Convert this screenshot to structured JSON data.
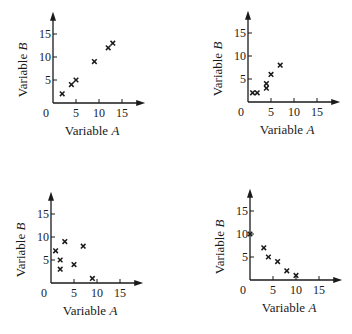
{
  "chart_data": [
    {
      "type": "scatter",
      "panel": "top-left",
      "title": "",
      "xlabel": "Variable A",
      "ylabel": "Variable B",
      "xticks": [
        "0",
        "5",
        "10",
        "15"
      ],
      "yticks": [
        "5",
        "10",
        "15"
      ],
      "xlim": [
        0,
        17
      ],
      "ylim": [
        0,
        17
      ],
      "grid": false,
      "marker": "x",
      "points": [
        [
          2,
          2
        ],
        [
          4,
          4
        ],
        [
          5,
          5
        ],
        [
          9,
          9
        ],
        [
          12,
          12
        ],
        [
          13,
          13
        ]
      ]
    },
    {
      "type": "scatter",
      "panel": "top-right",
      "title": "",
      "xlabel": "Variable A",
      "ylabel": "Variable B",
      "xticks": [
        "0",
        "5",
        "10",
        "15"
      ],
      "yticks": [
        "5",
        "10",
        "15"
      ],
      "xlim": [
        0,
        17
      ],
      "ylim": [
        0,
        17
      ],
      "grid": false,
      "marker": "x",
      "points": [
        [
          1,
          2
        ],
        [
          2,
          2
        ],
        [
          4,
          3
        ],
        [
          4,
          4
        ],
        [
          5,
          6
        ],
        [
          7,
          8
        ]
      ]
    },
    {
      "type": "scatter",
      "panel": "bottom-left",
      "title": "",
      "xlabel": "Variable A",
      "ylabel": "Variable B",
      "xticks": [
        "0",
        "5",
        "10",
        "15"
      ],
      "yticks": [
        "5",
        "10",
        "15"
      ],
      "xlim": [
        0,
        17
      ],
      "ylim": [
        0,
        17
      ],
      "grid": false,
      "marker": "x",
      "points": [
        [
          1,
          7
        ],
        [
          2,
          5
        ],
        [
          2,
          3
        ],
        [
          3,
          9
        ],
        [
          5,
          4
        ],
        [
          7,
          8
        ],
        [
          9,
          1
        ]
      ]
    },
    {
      "type": "scatter",
      "panel": "bottom-right",
      "title": "",
      "xlabel": "Variable A",
      "ylabel": "Variable B",
      "xticks": [
        "0",
        "5",
        "10",
        "15"
      ],
      "yticks": [
        "5",
        "10",
        "15"
      ],
      "xlim": [
        0,
        17
      ],
      "ylim": [
        0,
        17
      ],
      "grid": false,
      "marker": "x",
      "points": [
        [
          0,
          10
        ],
        [
          3,
          7
        ],
        [
          4,
          5
        ],
        [
          6,
          4
        ],
        [
          8,
          2
        ],
        [
          10,
          1
        ]
      ]
    }
  ],
  "layout": [
    {
      "left": 0,
      "top": 0,
      "ox": 53,
      "oy": 103
    },
    {
      "left": 176,
      "top": 0,
      "ox": 72,
      "oy": 102
    },
    {
      "left": 0,
      "top": 167,
      "ox": 51,
      "oy": 116
    },
    {
      "left": 176,
      "top": 167,
      "ox": 74,
      "oy": 113
    }
  ],
  "scale": 4.6,
  "colors": {
    "ink": "#1a1a1a",
    "background": "#ffffff"
  }
}
